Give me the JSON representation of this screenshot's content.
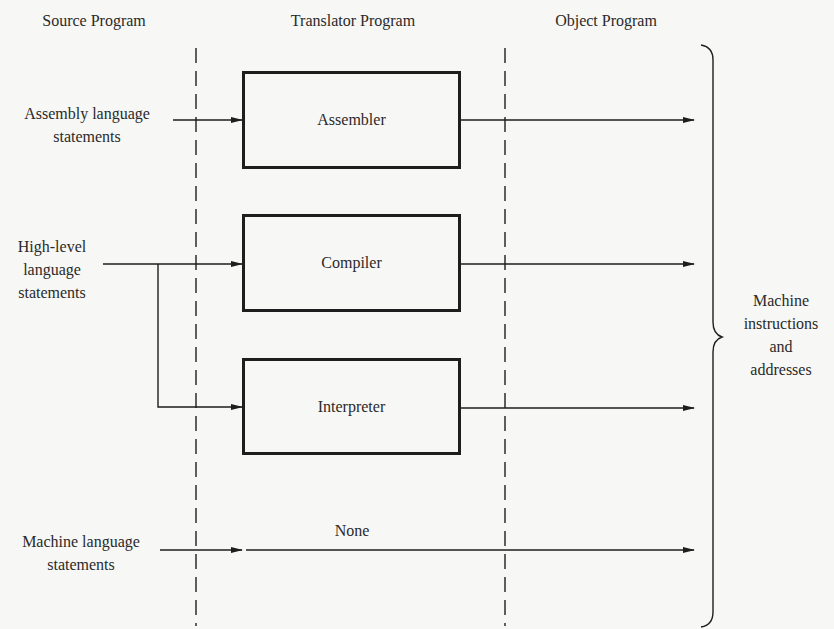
{
  "headers": {
    "source": "Source Program",
    "translator": "Translator Program",
    "object": "Object Program"
  },
  "sources": [
    {
      "id": "assembly",
      "lines": [
        "Assembly language",
        "statements"
      ]
    },
    {
      "id": "high_level",
      "lines": [
        "High-level",
        "language",
        "statements"
      ]
    },
    {
      "id": "machine",
      "lines": [
        "Machine language",
        "statements"
      ]
    }
  ],
  "translators": [
    {
      "id": "assembler",
      "label": "Assembler"
    },
    {
      "id": "compiler",
      "label": "Compiler"
    },
    {
      "id": "interpreter",
      "label": "Interpreter"
    }
  ],
  "none_label": "None",
  "output": {
    "lines": [
      "Machine",
      "instructions",
      "and",
      "addresses"
    ]
  },
  "colors": {
    "ink": "#1e1e1e",
    "background": "#f7f7f5"
  }
}
